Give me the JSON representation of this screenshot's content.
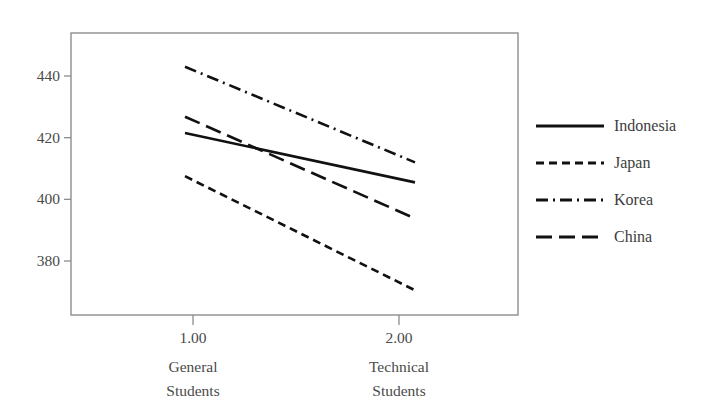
{
  "chart_data": {
    "type": "line",
    "title": "",
    "subtitle": "",
    "xlabel": "",
    "ylabel": "",
    "x": [
      1.0,
      2.0
    ],
    "categories": [
      "1.00",
      "2.00"
    ],
    "category_labels": [
      [
        "General",
        "Students"
      ],
      [
        "Technical",
        "Students"
      ]
    ],
    "xtick_labels": [
      "1.00",
      "2.00"
    ],
    "ytick_labels": [
      "440",
      "420",
      "400",
      "380"
    ],
    "yticks": [
      440,
      420,
      400,
      380
    ],
    "ylim": [
      365,
      450
    ],
    "xlim": [
      0.6,
      2.45
    ],
    "grid": false,
    "legend_position": "right",
    "series": [
      {
        "name": "Indonesia",
        "values": [
          421.5,
          405.5
        ],
        "style": "solid",
        "dash": "none",
        "color": "#111111"
      },
      {
        "name": "Japan",
        "values": [
          407.5,
          370.5
        ],
        "style": "dashed",
        "dash": "8,5",
        "color": "#111111"
      },
      {
        "name": "Korea",
        "values": [
          443.0,
          412.0
        ],
        "style": "dash-dot",
        "dash": "12,5,2,5",
        "color": "#111111"
      },
      {
        "name": "China",
        "values": [
          426.8,
          393.8
        ],
        "style": "long-dash",
        "dash": "16,7",
        "color": "#111111"
      }
    ]
  },
  "legend": {
    "items": [
      {
        "label": "Indonesia",
        "dash": "none"
      },
      {
        "label": "Japan",
        "dash": "8,5"
      },
      {
        "label": "Korea",
        "dash": "12,5,2,5"
      },
      {
        "label": "China",
        "dash": "16,7"
      }
    ]
  },
  "axes": {
    "y_ticks": [
      {
        "label": "440",
        "value": 440
      },
      {
        "label": "420",
        "value": 420
      },
      {
        "label": "400",
        "value": 400
      },
      {
        "label": "380",
        "value": 380
      }
    ],
    "x_ticks": [
      {
        "label": "1.00",
        "value": 1.0,
        "caption_line1": "General",
        "caption_line2": "Students"
      },
      {
        "label": "2.00",
        "value": 2.0,
        "caption_line1": "Technical",
        "caption_line2": "Students"
      }
    ]
  },
  "colors": {
    "line": "#111111",
    "axis": "#8d8d8d",
    "text": "#4a4a4a",
    "background": "#ffffff"
  }
}
